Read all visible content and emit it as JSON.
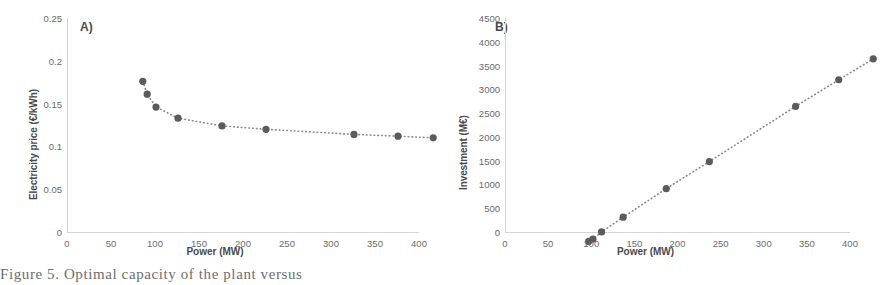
{
  "caption": {
    "text": "Figure 5. Optimal capacity of the plant versus"
  },
  "chart_data": [
    {
      "id": "A",
      "panel_label": "A)",
      "type": "scatter",
      "title": "",
      "xlabel": "Power (MW)",
      "ylabel": "Electricity price (€/kWh)",
      "xlim": [
        0,
        400
      ],
      "ylim": [
        0,
        0.25
      ],
      "xticks": [
        0,
        50,
        100,
        150,
        200,
        250,
        300,
        350,
        400
      ],
      "xticklabels": [
        "0",
        "50",
        "100",
        "150",
        "200",
        "250",
        "300",
        "350",
        "400"
      ],
      "yticks": [
        0,
        0.05,
        0.1,
        0.15,
        0.2,
        0.25
      ],
      "yticklabels": [
        "0",
        "0.05",
        "0.1",
        "0.15",
        "0.2",
        "0.25"
      ],
      "grid": false,
      "legend": "none",
      "marker_color": "#5b5b5b",
      "trend_color": "#8a8a8a",
      "trendline": "dotted",
      "x": [
        10,
        15,
        25,
        50,
        100,
        150,
        250,
        300,
        340
      ],
      "y": [
        0.197,
        0.182,
        0.167,
        0.154,
        0.145,
        0.141,
        0.135,
        0.133,
        0.131
      ]
    },
    {
      "id": "B",
      "panel_label": "B)",
      "type": "scatter",
      "title": "",
      "xlabel": "Power (MW)",
      "ylabel": "Investment (M€)",
      "xlim": [
        0,
        400
      ],
      "ylim": [
        0,
        4500
      ],
      "xticks": [
        0,
        50,
        100,
        150,
        200,
        250,
        300,
        350,
        400
      ],
      "xticklabels": [
        "0",
        "50",
        "100",
        "150",
        "200",
        "250",
        "300",
        "350",
        "400"
      ],
      "yticks": [
        0,
        500,
        1000,
        1500,
        2000,
        2500,
        3000,
        3500,
        4000,
        4500
      ],
      "yticklabels": [
        "0",
        "500",
        "1000",
        "1500",
        "2000",
        "2500",
        "3000",
        "3500",
        "4000",
        "4500"
      ],
      "grid": false,
      "legend": "none",
      "marker_color": "#5b5b5b",
      "trend_color": "#8a8a8a",
      "trendline": "dotted",
      "x": [
        10,
        15,
        25,
        50,
        100,
        150,
        250,
        300,
        340
      ],
      "y": [
        180,
        230,
        380,
        690,
        1290,
        1860,
        3020,
        3580,
        4020
      ]
    }
  ]
}
